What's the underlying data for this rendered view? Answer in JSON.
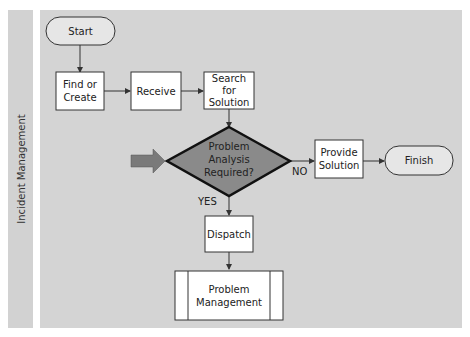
{
  "lane": {
    "label": "Incident Management"
  },
  "nodes": {
    "start": {
      "label": "Start"
    },
    "find_or_create": {
      "line1": "Find or",
      "line2": "Create"
    },
    "receive": {
      "label": "Receive"
    },
    "search": {
      "line1": "Search",
      "line2": "for",
      "line3": "Solution"
    },
    "decision": {
      "line1": "Problem",
      "line2": "Analysis",
      "line3": "Required?"
    },
    "provide": {
      "line1": "Provide",
      "line2": "Solution"
    },
    "finish": {
      "label": "Finish"
    },
    "dispatch": {
      "label": "Dispatch"
    },
    "problem_mgmt": {
      "line1": "Problem",
      "line2": "Management"
    }
  },
  "edges": {
    "no_label": "NO",
    "yes_label": "YES"
  },
  "colors": {
    "lane": "#d4d4d4",
    "decision_fill": "#8a8a8a",
    "entry_arrow": "#7a7a7a",
    "terminal_fill": "#e6e6e6"
  }
}
